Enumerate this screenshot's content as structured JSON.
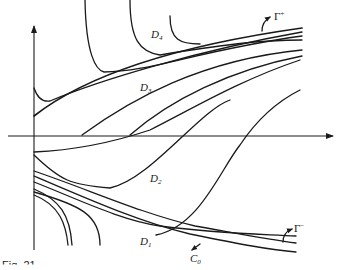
{
  "figure": {
    "caption": "Fig. 21",
    "labels": {
      "D4": {
        "main": "D",
        "sub": "4"
      },
      "D3": {
        "main": "D",
        "sub": "3"
      },
      "D2": {
        "main": "D",
        "sub": "2"
      },
      "D1": {
        "main": "D",
        "sub": "1"
      },
      "gamma_plus": {
        "main": "Γ",
        "sup": "+"
      },
      "gamma_minus": {
        "main": "Γ",
        "sup": "−"
      },
      "C0": {
        "main": "C",
        "sub": "0"
      }
    }
  }
}
